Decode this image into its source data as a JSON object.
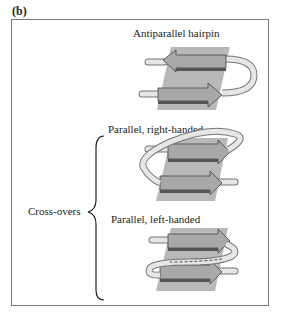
{
  "panel": {
    "label": "(b)"
  },
  "diagrams": [
    {
      "title": "Antiparallel hairpin",
      "type": "antiparallel-hairpin"
    },
    {
      "title": "Parallel, right-handed",
      "type": "parallel-right-handed"
    },
    {
      "title": "Parallel, left-handed",
      "type": "parallel-left-handed"
    }
  ],
  "group": {
    "label": "Cross-overs"
  },
  "colors": {
    "sheet_plane": "#b8b8b8",
    "strand_top": "#a8a8a8",
    "strand_side": "#555555",
    "loop": "#e6e6e6",
    "frame": "#777777"
  }
}
